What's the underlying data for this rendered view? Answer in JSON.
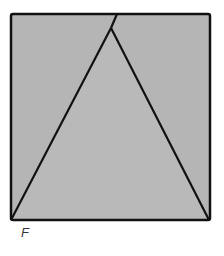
{
  "figure": {
    "label": "F",
    "fill_color": "#b5b5b5",
    "stroke_color": "#111111"
  }
}
